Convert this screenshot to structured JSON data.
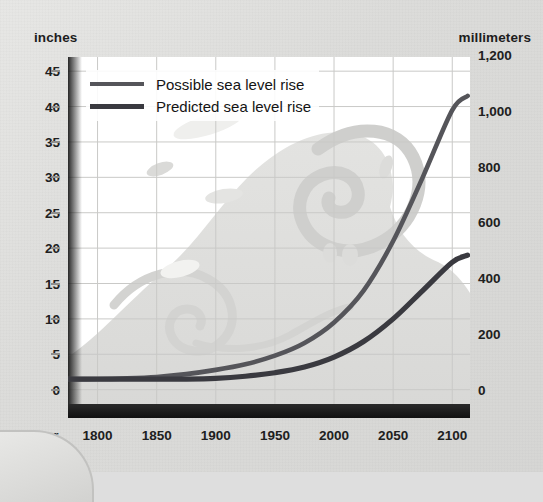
{
  "axes": {
    "left_units": "inches",
    "right_units": "millimeters",
    "x_name": "Year"
  },
  "legend": {
    "items": [
      {
        "label": "Possible sea level rise",
        "color": "#55555a",
        "style": "possible"
      },
      {
        "label": "Predicted sea level rise",
        "color": "#3a3a40",
        "style": "predicted"
      }
    ]
  },
  "chart_data": {
    "type": "line",
    "title": "",
    "xlabel": "Year",
    "ylabel": "inches",
    "y2label": "millimeters",
    "xlim": [
      1775,
      2115
    ],
    "ylim": [
      -4,
      47
    ],
    "y2lim": [
      -102,
      1194
    ],
    "grid": true,
    "legend_position": "top-left inside plot",
    "xticks": [
      1800,
      1850,
      1900,
      1950,
      2000,
      2050,
      2100
    ],
    "xticklabels": [
      "1800",
      "1850",
      "1900",
      "1950",
      "2000",
      "2050",
      "2100"
    ],
    "yticks": [
      0,
      5,
      10,
      15,
      20,
      25,
      30,
      35,
      40,
      45
    ],
    "yticklabels": [
      "0",
      "5",
      "10",
      "15",
      "20",
      "25",
      "30",
      "35",
      "40",
      "45"
    ],
    "y2ticks": [
      0,
      200,
      400,
      600,
      800,
      1000,
      1200
    ],
    "y2ticklabels": [
      "0",
      "200",
      "400",
      "600",
      "800",
      "1,000",
      "1,200"
    ],
    "series": [
      {
        "name": "Possible sea level rise",
        "color": "#55555a",
        "x": [
          1775,
          1800,
          1825,
          1850,
          1875,
          1900,
          1925,
          1950,
          1975,
          2000,
          2025,
          2050,
          2075,
          2100,
          2113
        ],
        "y": [
          1.5,
          1.5,
          1.6,
          1.8,
          2.2,
          2.8,
          3.6,
          4.8,
          6.6,
          9.5,
          14.0,
          21.0,
          30.0,
          39.5,
          41.5
        ],
        "y_mm": [
          38,
          38,
          41,
          46,
          56,
          71,
          91,
          122,
          168,
          241,
          356,
          533,
          762,
          1003,
          1054
        ]
      },
      {
        "name": "Predicted sea level rise",
        "color": "#3a3a40",
        "x": [
          1775,
          1800,
          1825,
          1850,
          1875,
          1900,
          1925,
          1950,
          1975,
          2000,
          2025,
          2050,
          2075,
          2100,
          2113
        ],
        "y": [
          1.5,
          1.5,
          1.5,
          1.5,
          1.5,
          1.6,
          1.9,
          2.4,
          3.2,
          4.6,
          6.8,
          10.0,
          14.0,
          18.0,
          19.0
        ],
        "y_mm": [
          38,
          38,
          38,
          38,
          38,
          41,
          48,
          61,
          81,
          117,
          173,
          254,
          356,
          457,
          483
        ]
      }
    ],
    "annotations": [
      "Decorative breaking-wave illustration watermark in plot background",
      "Gray sea-water band below the 0 inch baseline"
    ]
  }
}
